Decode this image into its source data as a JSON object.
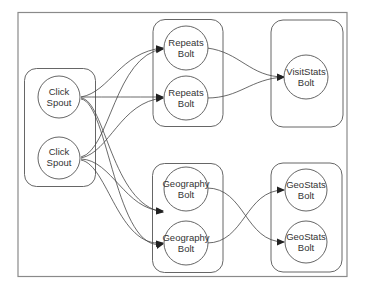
{
  "diagram": {
    "title": "",
    "containers": [
      {
        "id": "spouts",
        "label": ""
      },
      {
        "id": "repeats",
        "label": ""
      },
      {
        "id": "visitstats",
        "label": ""
      },
      {
        "id": "geography",
        "label": ""
      },
      {
        "id": "geostats",
        "label": ""
      }
    ],
    "nodes": [
      {
        "id": "spout1",
        "line1": "Click",
        "line2": "Spout"
      },
      {
        "id": "spout2",
        "line1": "Click",
        "line2": "Spout"
      },
      {
        "id": "repeats1",
        "line1": "Repeats",
        "line2": "Bolt"
      },
      {
        "id": "repeats2",
        "line1": "Repeats",
        "line2": "Bolt"
      },
      {
        "id": "visitstats",
        "line1": "VisitStats",
        "line2": "Bolt"
      },
      {
        "id": "geography1",
        "line1": "Geography",
        "line2": "Bolt"
      },
      {
        "id": "geography2",
        "line1": "Geography",
        "line2": "Bolt"
      },
      {
        "id": "geostats1",
        "line1": "GeoStats",
        "line2": "Bolt"
      },
      {
        "id": "geostats2",
        "line1": "GeoStats",
        "line2": "Bolt"
      }
    ],
    "edges": [
      {
        "from": "spout1",
        "to": "repeats1"
      },
      {
        "from": "spout1",
        "to": "repeats2"
      },
      {
        "from": "spout1",
        "to": "geography1"
      },
      {
        "from": "spout1",
        "to": "geography2"
      },
      {
        "from": "spout2",
        "to": "repeats1"
      },
      {
        "from": "spout2",
        "to": "repeats2"
      },
      {
        "from": "spout2",
        "to": "geography1"
      },
      {
        "from": "spout2",
        "to": "geography2"
      },
      {
        "from": "repeats1",
        "to": "visitstats"
      },
      {
        "from": "repeats2",
        "to": "visitstats"
      },
      {
        "from": "geography1",
        "to": "geostats2"
      },
      {
        "from": "geography2",
        "to": "geostats1"
      }
    ],
    "colors": {
      "stroke": "#444444",
      "frame": "#8a8a8a",
      "background": "#ffffff"
    }
  }
}
